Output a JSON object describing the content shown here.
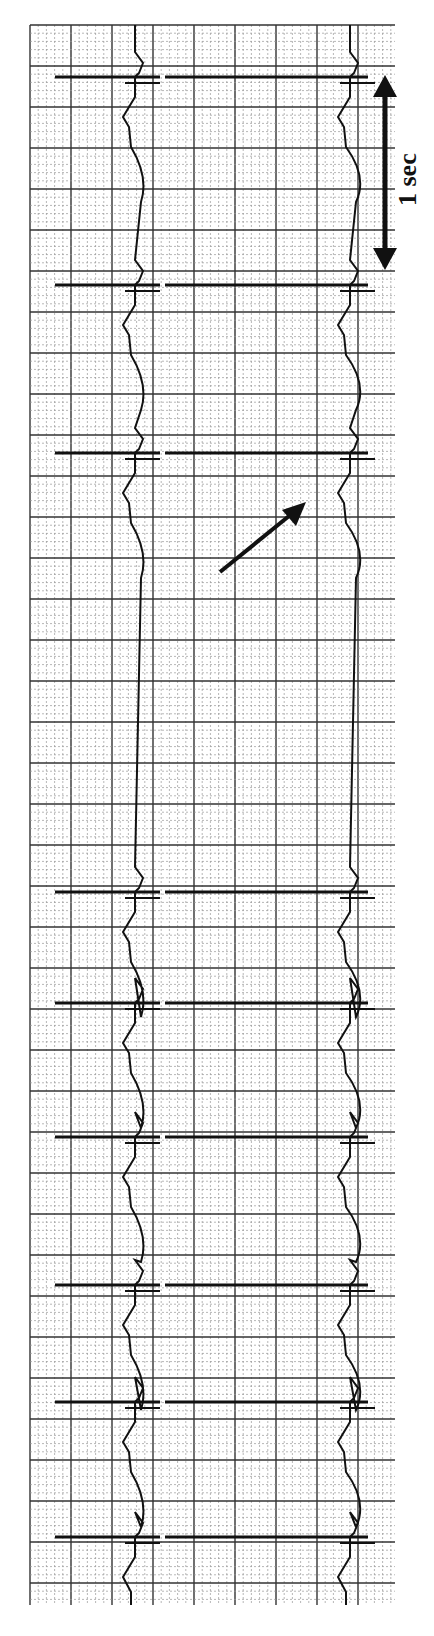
{
  "figure": {
    "type": "ECG rhythm strip (rotated 90°)",
    "scale_bar": {
      "label": "1 sec",
      "y_start": 75,
      "y_end": 270,
      "x": 385
    },
    "arrow_annotation": {
      "from": [
        220,
        572
      ],
      "to": [
        306,
        502
      ],
      "points_to": "long pause between beats"
    },
    "grid": {
      "x_min": 30,
      "x_max": 395,
      "y_min": 25,
      "y_max": 1605,
      "major_spacing": 41,
      "minor_spacing": 8.2
    },
    "traces": [
      {
        "name": "lead-1",
        "baseline_x": 135
      },
      {
        "name": "lead-2",
        "baseline_x": 350
      }
    ],
    "qrs_positions_y": [
      77,
      285,
      453,
      892,
      1003,
      1137,
      1285,
      1402,
      1537
    ],
    "colors": {
      "ink": "#111111",
      "grid_major": "#333333",
      "grid_minor": "#9a9a9a",
      "paper": "#ffffff"
    }
  }
}
